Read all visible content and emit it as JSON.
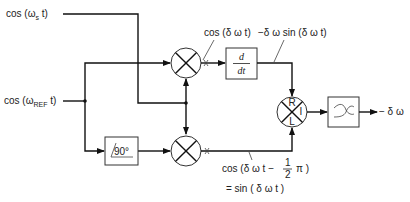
{
  "diagram": {
    "inputs": {
      "signal": "cos (ω",
      "signal_sub": "s",
      "signal_tail": " t)",
      "reference": "cos (ω",
      "reference_sub": "REF",
      "reference_tail": " t)"
    },
    "blocks": {
      "phase_shift": "∠-90°",
      "phase_shift_angle": "90°",
      "differentiator_num": "d",
      "differentiator_den": "dt",
      "mixer_ports": {
        "r": "R",
        "i": "I",
        "l": "L"
      },
      "filter": "low-pass filter"
    },
    "signals": {
      "top_mixer_out": "cos (δ ω t)",
      "derivative_out": "−δ ω sin (δ ω t)",
      "bottom_mixer_out_line1_pre": "cos (δ ω t −",
      "bottom_mixer_out_frac_num": "1",
      "bottom_mixer_out_frac_den": "2",
      "bottom_mixer_out_line1_post": "π )",
      "bottom_mixer_out_line2": "= sin ( δ ω t )",
      "output": "− δ ω"
    }
  }
}
